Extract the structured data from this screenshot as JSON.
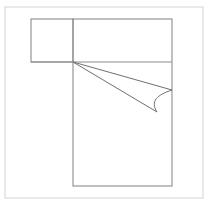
{
  "document": {
    "title": "Bed Plan Symbol",
    "canvas": {
      "width": 211,
      "height": 205
    },
    "background_color": "#ffffff"
  },
  "colors": {
    "frame_stroke": "#d4d4d4",
    "outline_stroke": "#8c8c8c",
    "detail_stroke": "#6f6f6f",
    "fill": "#ffffff"
  },
  "drawing": {
    "type": "floor-plan-symbol",
    "subject": "bed-with-nightstand",
    "frame": {
      "name": "outer-frame",
      "x": 5,
      "y": 7,
      "width": 198,
      "height": 191,
      "stroke_width": 1
    },
    "shapes": [
      {
        "name": "nightstand-rect",
        "label": "Nightstand",
        "x": 31,
        "y": 19,
        "width": 42,
        "height": 43,
        "stroke_width": 1.1
      },
      {
        "name": "bed-rect",
        "label": "Bed",
        "x": 73,
        "y": 19,
        "width": 99,
        "height": 167,
        "stroke_width": 1.1
      }
    ],
    "lines": [
      {
        "name": "pillow-divider-line",
        "label": "Pillow divider",
        "x1": 31,
        "y1": 62,
        "x2": 172,
        "y2": 62,
        "stroke_width": 1.1
      },
      {
        "name": "blanket-fold-line-upper",
        "label": "Blanket fold upper",
        "x1": 73,
        "y1": 62,
        "x2": 172,
        "y2": 90,
        "stroke_width": 1
      },
      {
        "name": "blanket-fold-line-lower",
        "label": "Blanket fold lower",
        "x1": 73,
        "y1": 62,
        "x2": 157,
        "y2": 112,
        "stroke_width": 1
      }
    ],
    "arcs": [
      {
        "name": "blanket-fold-arc",
        "label": "Blanket fold arc",
        "path": "M 172 90 C 157 95 150 101 157 112",
        "stroke_width": 1
      }
    ]
  }
}
